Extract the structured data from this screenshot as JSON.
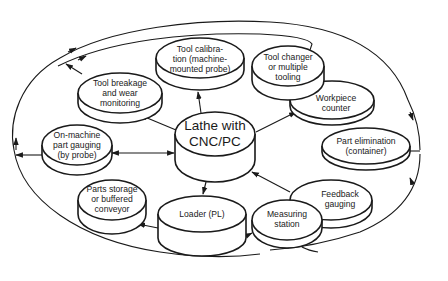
{
  "diagram": {
    "type": "flow-diagram",
    "colors": {
      "line": "#1a1a1a",
      "background": "#ffffff"
    },
    "center": {
      "id": "lathe",
      "lines": [
        "Lathe with",
        "CNC/PC"
      ]
    },
    "nodes": [
      {
        "id": "tool_calibration",
        "lines": [
          "Tool calibra-",
          "tion (machine-",
          "mounted probe)"
        ]
      },
      {
        "id": "tool_breakage",
        "lines": [
          "Tool breakage",
          "and wear",
          "monitoring"
        ]
      },
      {
        "id": "tool_changer",
        "lines": [
          "Tool changer",
          "or multiple",
          "tooling"
        ]
      },
      {
        "id": "workpiece_counter",
        "lines": [
          "Workpiece",
          "counter"
        ]
      },
      {
        "id": "on_machine_gauging",
        "lines": [
          "On-machine",
          "part gauging",
          "(by probe)"
        ]
      },
      {
        "id": "part_elimination",
        "lines": [
          "Part elimination",
          "(container)"
        ]
      },
      {
        "id": "parts_storage",
        "lines": [
          "Parts storage",
          "or buffered",
          "conveyor"
        ]
      },
      {
        "id": "loader",
        "lines": [
          "Loader (PL)"
        ]
      },
      {
        "id": "feedback_gauging",
        "lines": [
          "Feedback",
          "gauging"
        ]
      },
      {
        "id": "measuring_station",
        "lines": [
          "Measuring",
          "station"
        ]
      }
    ],
    "edges": [
      {
        "from": "lathe",
        "to": "tool_calibration",
        "bidirectional": true
      },
      {
        "from": "lathe",
        "to": "tool_breakage"
      },
      {
        "from": "lathe",
        "to": "workpiece_counter"
      },
      {
        "from": "lathe",
        "to": "on_machine_gauging",
        "bidirectional": true
      },
      {
        "from": "lathe",
        "to": "loader"
      },
      {
        "from": "feedback_gauging",
        "to": "lathe"
      },
      {
        "from": "loader",
        "to": "parts_storage"
      },
      {
        "from": "loader",
        "to": "measuring_station"
      },
      {
        "from": "outer_loop",
        "to": "part_elimination"
      },
      {
        "from": "outer_loop",
        "to": "measuring_station"
      },
      {
        "from": "tool_breakage",
        "to": "outer_loop"
      },
      {
        "from": "on_machine_gauging",
        "to": "outer_loop"
      },
      {
        "from": "tool_changer",
        "to": "outer_loop"
      }
    ]
  }
}
